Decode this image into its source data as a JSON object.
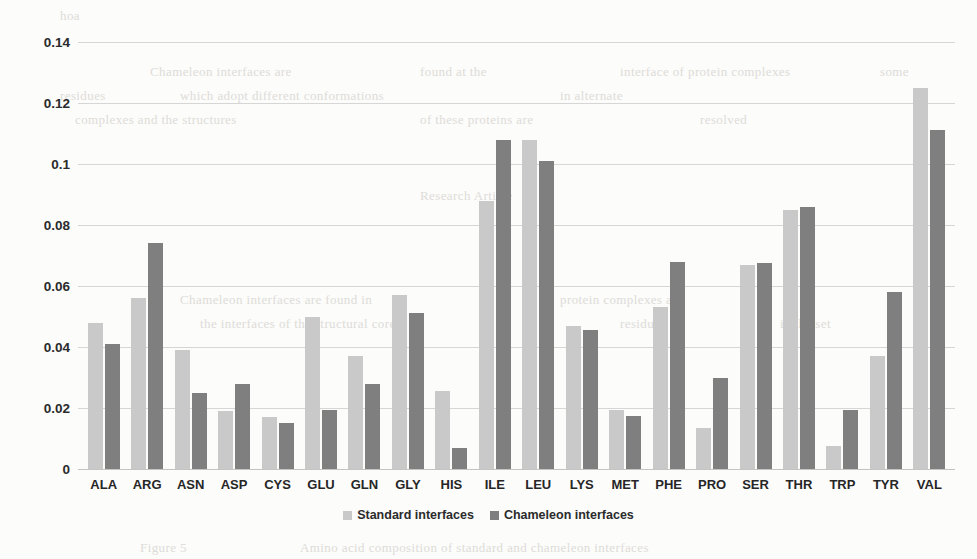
{
  "chart_data": {
    "type": "bar",
    "title": "",
    "xlabel": "",
    "ylabel": "",
    "ylim": [
      0,
      0.14
    ],
    "grid": true,
    "legend_position": "bottom-center",
    "categories": [
      "ALA",
      "ARG",
      "ASN",
      "ASP",
      "CYS",
      "GLU",
      "GLN",
      "GLY",
      "HIS",
      "ILE",
      "LEU",
      "LYS",
      "MET",
      "PHE",
      "PRO",
      "SER",
      "THR",
      "TRP",
      "TYR",
      "VAL"
    ],
    "y_ticks": [
      "0",
      "0.02",
      "0.04",
      "0.06",
      "0.08",
      "0.1",
      "0.12",
      "0.14"
    ],
    "y_tick_values": [
      0,
      0.02,
      0.04,
      0.06,
      0.08,
      0.1,
      0.12,
      0.14
    ],
    "series": [
      {
        "name": "Standard interfaces",
        "color": "#c9c9c9",
        "values": [
          0.048,
          0.056,
          0.039,
          0.019,
          0.017,
          0.05,
          0.037,
          0.057,
          0.0255,
          0.088,
          0.108,
          0.047,
          0.0195,
          0.053,
          0.0135,
          0.067,
          0.085,
          0.0075,
          0.037,
          0.125
        ]
      },
      {
        "name": "Chameleon interfaces",
        "color": "#7f7f7f",
        "values": [
          0.041,
          0.074,
          0.025,
          0.028,
          0.015,
          0.0195,
          0.028,
          0.051,
          0.007,
          0.108,
          0.101,
          0.0455,
          0.0175,
          0.068,
          0.03,
          0.0675,
          0.086,
          0.0195,
          0.058,
          0.111
        ]
      }
    ]
  },
  "legend": {
    "items": [
      {
        "label": "Standard interfaces"
      },
      {
        "label": "Chameleon interfaces"
      }
    ]
  },
  "background_artifacts": [
    {
      "text": "hoa",
      "x": 60,
      "y": 8
    },
    {
      "text": "Chameleon interfaces are",
      "x": 150,
      "y": 64
    },
    {
      "text": "found at the",
      "x": 420,
      "y": 64
    },
    {
      "text": "interface of protein complexes",
      "x": 620,
      "y": 64
    },
    {
      "text": "some",
      "x": 880,
      "y": 64
    },
    {
      "text": "residues",
      "x": 60,
      "y": 88
    },
    {
      "text": "which adopt different conformations",
      "x": 180,
      "y": 88
    },
    {
      "text": "in alternate",
      "x": 560,
      "y": 88
    },
    {
      "text": "complexes and the structures",
      "x": 75,
      "y": 112
    },
    {
      "text": "of these proteins are",
      "x": 420,
      "y": 112
    },
    {
      "text": "resolved",
      "x": 700,
      "y": 112
    },
    {
      "text": "Research Article",
      "x": 420,
      "y": 188
    },
    {
      "text": "Chameleon interfaces are found in",
      "x": 180,
      "y": 292
    },
    {
      "text": "protein complexes at",
      "x": 560,
      "y": 292
    },
    {
      "text": "the interfaces of the structural core",
      "x": 200,
      "y": 316
    },
    {
      "text": "residues",
      "x": 620,
      "y": 316
    },
    {
      "text": "in the set",
      "x": 780,
      "y": 316
    },
    {
      "text": "Figure 5",
      "x": 140,
      "y": 540
    },
    {
      "text": "Amino acid composition of standard and chameleon interfaces",
      "x": 300,
      "y": 540
    }
  ]
}
